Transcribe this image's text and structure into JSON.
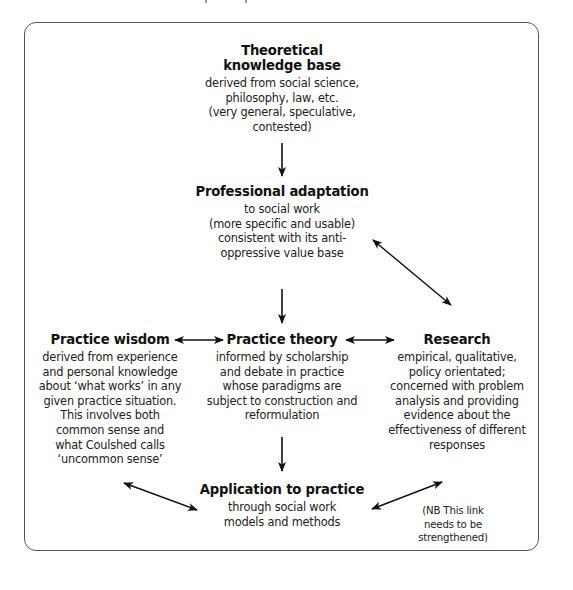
{
  "diagram": {
    "nodes": {
      "theoretical": {
        "title": "Theoretical\nknowledge base",
        "title_lines": [
          "Theoretical",
          "knowledge base"
        ],
        "body": "derived from social science,\nphilosophy, law, etc.\n(very general, speculative,\ncontested)"
      },
      "professional": {
        "title": "Professional adaptation",
        "body": "to social work\n(more specific and usable)\nconsistent with its anti-\noppressive value base"
      },
      "wisdom": {
        "title": "Practice wisdom",
        "body": "derived from experience\nand personal knowledge\nabout ‘what works’ in any\ngiven practice situation.\nThis involves both\ncommon sense and\nwhat Coulshed calls\n‘uncommon sense’"
      },
      "theory": {
        "title": "Practice theory",
        "body": "informed by scholarship\nand debate in practice\nwhose paradigms are\nsubject to construction and\nreformulation"
      },
      "research": {
        "title": "Research",
        "body": "empirical, qualitative,\npolicy orientated;\nconcerned with problem\nanalysis and providing\nevidence about the\neffectiveness of different\nresponses"
      },
      "application": {
        "title": "Application to practice",
        "body": "through social work\nmodels and methods"
      }
    },
    "note": "(NB This link\nneeds to be\nstrengthened)",
    "edges": [
      {
        "from": "theoretical",
        "to": "professional",
        "type": "one-way"
      },
      {
        "from": "professional",
        "to": "theory",
        "type": "one-way"
      },
      {
        "from": "theory",
        "to": "application",
        "type": "one-way"
      },
      {
        "from": "wisdom",
        "to": "theory",
        "type": "two-way"
      },
      {
        "from": "theory",
        "to": "research",
        "type": "two-way"
      },
      {
        "from": "professional",
        "to": "research",
        "type": "two-way"
      },
      {
        "from": "wisdom",
        "to": "application",
        "type": "two-way"
      },
      {
        "from": "research",
        "to": "application",
        "type": "two-way"
      }
    ],
    "colors": {
      "frame": "#555555",
      "text": "#1a1a1a",
      "arrow": "#111111",
      "background": "#ffffff"
    }
  }
}
